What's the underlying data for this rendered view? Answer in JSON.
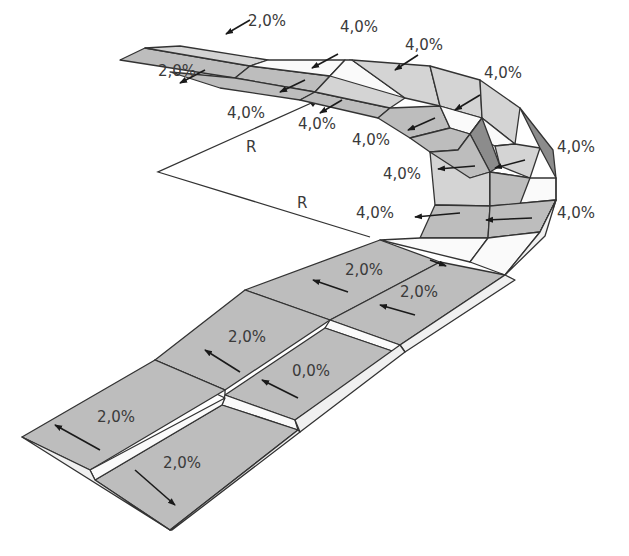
{
  "diagram": {
    "labels": {
      "radius_upper": "R",
      "radius_lower": "R",
      "top_left_outer": "2,0%",
      "top_left_inner": "2,0%",
      "top_mid_1": "4,0%",
      "top_mid_2": "4,0%",
      "top_right_1": "4,0%",
      "right_outer_1": "4,0%",
      "right_outer_2": "4,0%",
      "inner_1": "4,0%",
      "inner_2": "4,0%",
      "inner_3": "4,0%",
      "inner_4": "4,0%",
      "inner_5": "4,0%",
      "straight_outer_1": "2,0%",
      "straight_outer_2": "2,0%",
      "straight_inner_1": "2,0%",
      "straight_center": "0,0%",
      "bottom_left": "2,0%",
      "bottom_right": "2,0%"
    },
    "colors": {
      "road_surface": "#bdbdbd",
      "road_surface_light": "#d4d4d4",
      "side_face": "#f0f0f0",
      "side_face_dark": "#8c8c8c",
      "lines": "#333333",
      "text": "#3a3a3a"
    }
  }
}
